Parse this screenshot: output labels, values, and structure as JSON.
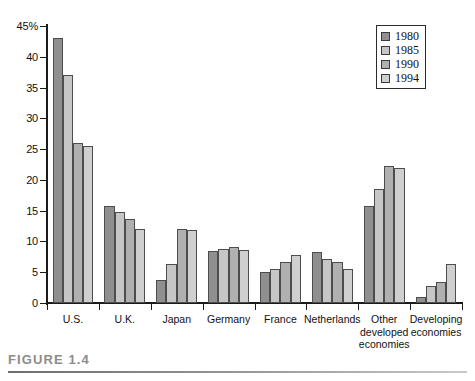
{
  "figure": {
    "caption_label": "FIGURE 1.4"
  },
  "legend": {
    "position": "top-right",
    "entries": [
      {
        "label": "1980",
        "color": "#8f8f8f"
      },
      {
        "label": "1985",
        "color": "#c6c6c6"
      },
      {
        "label": "1990",
        "color": "#b0b0b0"
      },
      {
        "label": "1994",
        "color": "#cfcfcf"
      }
    ]
  },
  "chart_data": {
    "type": "bar",
    "title": "",
    "xlabel": "",
    "ylabel": "",
    "ylim": [
      0,
      45
    ],
    "grid": false,
    "legend_position": "top-right",
    "ytick_labels": [
      "0",
      "5",
      "10",
      "15",
      "20",
      "25",
      "30",
      "35",
      "40",
      "45%"
    ],
    "ytick_values": [
      0,
      5,
      10,
      15,
      20,
      25,
      30,
      35,
      40,
      45
    ],
    "categories": [
      "U.S.",
      "U.K.",
      "Japan",
      "Germany",
      "France",
      "Netherlands",
      "Other\ndeveloped\neconomies",
      "Developing\neconomies"
    ],
    "series": [
      {
        "name": "1980",
        "color": "#8f8f8f",
        "values": [
          43.0,
          15.7,
          3.8,
          8.5,
          5.1,
          8.3,
          15.7,
          1.0
        ]
      },
      {
        "name": "1985",
        "color": "#c6c6c6",
        "values": [
          37.0,
          14.8,
          6.3,
          8.8,
          5.6,
          7.1,
          18.5,
          2.7
        ]
      },
      {
        "name": "1990",
        "color": "#b0b0b0",
        "values": [
          26.0,
          13.7,
          12.0,
          9.1,
          6.7,
          6.7,
          22.3,
          3.4
        ]
      },
      {
        "name": "1994",
        "color": "#cfcfcf",
        "values": [
          25.5,
          12.1,
          11.8,
          8.6,
          7.8,
          5.6,
          22.0,
          6.4
        ]
      }
    ]
  }
}
